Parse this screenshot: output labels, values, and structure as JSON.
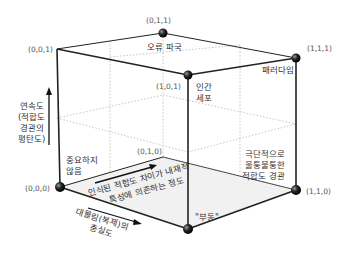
{
  "diagram": {
    "type": "3d-cube",
    "vertices": {
      "v000": {
        "label": "(0,0,0)",
        "name": "중요하지 않음",
        "lines": [
          "중요하지",
          "않음"
        ]
      },
      "v010": {
        "label": "(0,1,0)"
      },
      "v001": {
        "label": "(0,0,1)"
      },
      "v011": {
        "label": "(0,1,1)",
        "name": "오류 파국"
      },
      "v101": {
        "label": "(1,0,1)",
        "name": "인간 세포",
        "lines": [
          "인간",
          "세포"
        ]
      },
      "v111": {
        "label": "(1,1,1)",
        "name": "패러다임"
      },
      "v110": {
        "label": "(1,1,0)",
        "name": "극단적으로 울퉁불퉁한 적합도 경관",
        "lines": [
          "극단적으로",
          "울퉁불퉁한",
          "적합도 경관"
        ]
      },
      "v100": {
        "label": "(1,0,0)",
        "name": "\"부동\""
      }
    },
    "axes": {
      "vertical": {
        "lines": [
          "연속도",
          "(적합도",
          "경관의",
          "평탄도)"
        ]
      },
      "depth": {
        "lines": [
          "인식된 적합도 차이가 내재적",
          "특성에 의존하는 정도"
        ]
      },
      "horizontal": {
        "lines": [
          "대물림(복제)의",
          "충실도"
        ]
      }
    },
    "colors": {
      "edge": "#222222",
      "hidden_edge": "#b5b5b5",
      "floor": "#f0f0f0",
      "sphere": "#1a1a1a"
    }
  }
}
